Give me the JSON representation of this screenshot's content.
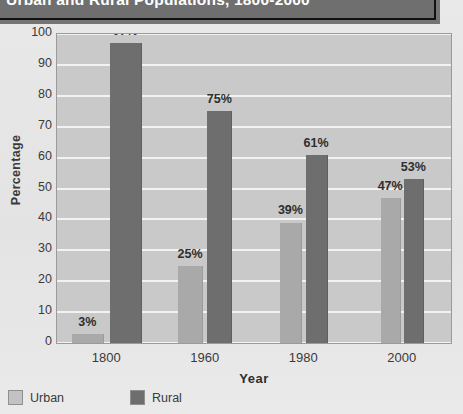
{
  "chart_data": {
    "type": "bar",
    "title": "Urban and Rural Populations, 1800-2000",
    "xlabel": "Year",
    "ylabel": "Percentage",
    "categories": [
      "1800",
      "1960",
      "1980",
      "2000"
    ],
    "series": [
      {
        "name": "Urban",
        "color": "#a9a9a9",
        "values": [
          3,
          25,
          39,
          47
        ],
        "labels": [
          "3%",
          "25%",
          "39%",
          "47%"
        ]
      },
      {
        "name": "Rural",
        "color": "#6e6e6e",
        "values": [
          97,
          75,
          61,
          53
        ],
        "labels": [
          "97%",
          "75%",
          "61%",
          "53%"
        ]
      }
    ],
    "ylim": [
      0,
      100
    ],
    "yticks": [
      "100",
      "90",
      "80",
      "70",
      "60",
      "50",
      "40",
      "30",
      "20",
      "10",
      "0"
    ],
    "grid": true,
    "legend_position": "bottom-left",
    "plot_background": "#c9c9c9",
    "title_background": "#6f6f6f",
    "title_color": "#ffffff"
  }
}
